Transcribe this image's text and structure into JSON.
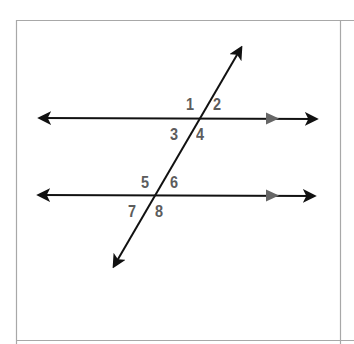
{
  "diagram": {
    "type": "parallel-lines-cut-by-transversal",
    "colors": {
      "line": "#111111",
      "parallel_marker": "#666666",
      "label": "#5c5c5c",
      "border": "#a8a8a8",
      "background": "#ffffff"
    },
    "lines": [
      {
        "id": "upper-parallel-line",
        "from": [
          38,
          118
        ],
        "to": [
          318,
          119
        ],
        "arrows": "both",
        "parallel_marker_at": [
          272,
          118
        ]
      },
      {
        "id": "lower-parallel-line",
        "from": [
          37,
          195
        ],
        "to": [
          316,
          196
        ],
        "arrows": "both",
        "parallel_marker_at": [
          272,
          196
        ]
      },
      {
        "id": "transversal",
        "from": [
          113,
          268
        ],
        "to": [
          242,
          46
        ],
        "arrows": "both"
      }
    ],
    "angles": [
      {
        "number": "1",
        "x": 186,
        "y": 96
      },
      {
        "number": "2",
        "x": 213,
        "y": 96
      },
      {
        "number": "3",
        "x": 170,
        "y": 126
      },
      {
        "number": "4",
        "x": 196,
        "y": 126
      },
      {
        "number": "5",
        "x": 141,
        "y": 174
      },
      {
        "number": "6",
        "x": 170,
        "y": 174
      },
      {
        "number": "7",
        "x": 128,
        "y": 203
      },
      {
        "number": "8",
        "x": 155,
        "y": 203
      }
    ]
  }
}
